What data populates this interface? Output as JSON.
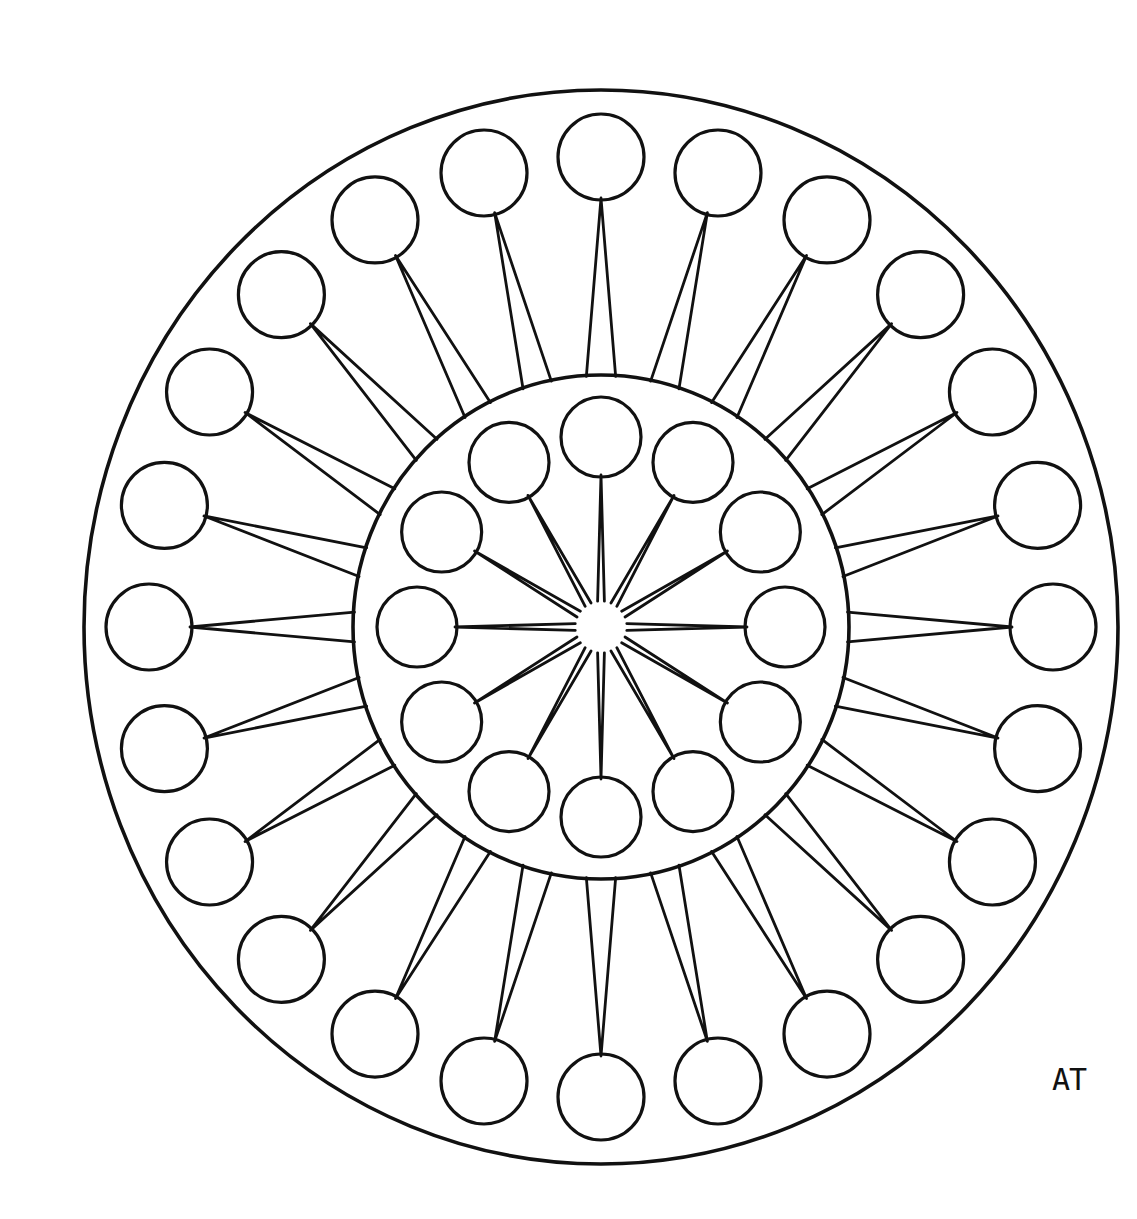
{
  "artwork": {
    "title": "Mandala Coloring Page",
    "type": "line-art-mandala",
    "background_color": "#ffffff",
    "stroke_color": "#111111",
    "signature": "AT",
    "signature_position": "bottom-right"
  },
  "geometry": {
    "canvas": {
      "width": 1137,
      "height": 1219
    },
    "center": {
      "x": 601,
      "y": 627
    },
    "outer_boundary": {
      "name": "outer-boundary-circle",
      "radius_x": 517,
      "radius_y": 537,
      "stroke_width": 3.6
    },
    "inner_boundary": {
      "name": "inner-boundary-circle",
      "radius_x": 248,
      "radius_y": 252,
      "stroke_width": 3.6
    },
    "hub": {
      "name": "center-hub",
      "radius": 26
    },
    "outer_ring": {
      "count": 24,
      "angle_step_deg": 15,
      "angle_offset_deg": 0,
      "orbit_radius_x": 452,
      "orbit_radius_y": 470,
      "circle_radius": 43,
      "stroke_width": 3.2
    },
    "inner_ring": {
      "count": 12,
      "angle_step_deg": 30,
      "angle_offset_deg": 0,
      "orbit_radius_x": 184,
      "orbit_radius_y": 190,
      "circle_radius": 40,
      "stroke_width": 3.2
    },
    "inner_rays": {
      "count": 12,
      "description": "narrow wedge from center hub to each inner circle",
      "half_width_at_hub_deg": 7.5,
      "stroke_width": 2.8
    },
    "outer_rays": {
      "count": 24,
      "description": "narrow wedge from inner boundary edge to each outer circle",
      "half_width_at_base_deg": 3.4,
      "stroke_width": 2.8
    }
  },
  "labels": {
    "outer_ring_label": "outer-circle",
    "inner_ring_label": "inner-circle",
    "ray_label": "ray-wedge",
    "hub_label": "center-hub-star"
  }
}
